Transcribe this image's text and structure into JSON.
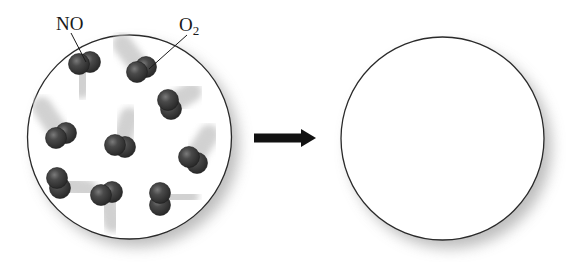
{
  "figure": {
    "background_color": "#ffffff"
  },
  "reactant_container": {
    "label": "reactant container",
    "center": [
      129.5,
      137
    ],
    "radius": 102,
    "stroke": "#2a2a2a",
    "molecules": [
      {
        "id": 1,
        "type": "NO",
        "atoms": [
          [
            79,
            64
          ],
          [
            90,
            62
          ]
        ],
        "trail": [
          -2,
          16
        ]
      },
      {
        "id": 2,
        "type": "O2",
        "atoms": [
          [
            137,
            72
          ],
          [
            146,
            67
          ]
        ],
        "trail": [
          -12,
          -16
        ]
      },
      {
        "id": 3,
        "type": "molecule",
        "atoms": [
          [
            168,
            100
          ],
          [
            171,
            109
          ]
        ],
        "trail": [
          14,
          -8
        ]
      },
      {
        "id": 4,
        "type": "molecule",
        "atoms": [
          [
            56,
            138
          ],
          [
            66,
            133
          ]
        ],
        "trail": [
          -12,
          -18
        ]
      },
      {
        "id": 5,
        "type": "molecule",
        "atoms": [
          [
            115,
            145
          ],
          [
            125,
            147
          ]
        ],
        "trail": [
          6,
          -18
        ]
      },
      {
        "id": 6,
        "type": "molecule",
        "atoms": [
          [
            189,
            157
          ],
          [
            197,
            163
          ]
        ],
        "trail": [
          10,
          -16
        ]
      },
      {
        "id": 7,
        "type": "molecule",
        "atoms": [
          [
            57,
            178
          ],
          [
            60,
            188
          ]
        ],
        "trail": [
          18,
          4
        ]
      },
      {
        "id": 8,
        "type": "molecule",
        "atoms": [
          [
            101,
            195
          ],
          [
            112,
            192
          ]
        ],
        "trail": [
          4,
          18
        ]
      },
      {
        "id": 9,
        "type": "molecule",
        "atoms": [
          [
            160,
            193
          ],
          [
            160,
            205
          ]
        ],
        "trail": [
          18,
          -2
        ]
      }
    ]
  },
  "labels": {
    "no_label": "NO",
    "o2_label_main": "O",
    "o2_label_sub": "2"
  },
  "arrow": {
    "direction": "right",
    "from": [
      254,
      138
    ],
    "to": [
      316,
      138
    ],
    "color": "#111111"
  },
  "product_container": {
    "label": "product container (empty)",
    "center": [
      442.5,
      138.5
    ],
    "radius": 101.5,
    "stroke": "#2a2a2a",
    "molecules": []
  },
  "colors": {
    "atom_fill": "#3b3b3b",
    "atom_highlight": "#8a8a8a",
    "trail": "#c9c9c9",
    "shadow": "#9a9a9a",
    "circle_stroke": "#2a2a2a"
  }
}
